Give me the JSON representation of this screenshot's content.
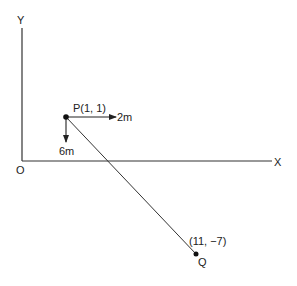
{
  "diagram": {
    "axes": {
      "x_label": "X",
      "y_label": "Y",
      "origin_label": "O"
    },
    "points": {
      "P": {
        "label": "P(1, 1)",
        "coords": [
          1,
          1
        ]
      },
      "Q": {
        "label": "Q",
        "coords_label": "(11,  −7)",
        "coords": [
          11,
          -7
        ]
      }
    },
    "vectors": {
      "east": {
        "label": "2m"
      },
      "south": {
        "label": "6m"
      }
    },
    "colors": {
      "ink": "#222222",
      "background": "#ffffff"
    }
  }
}
